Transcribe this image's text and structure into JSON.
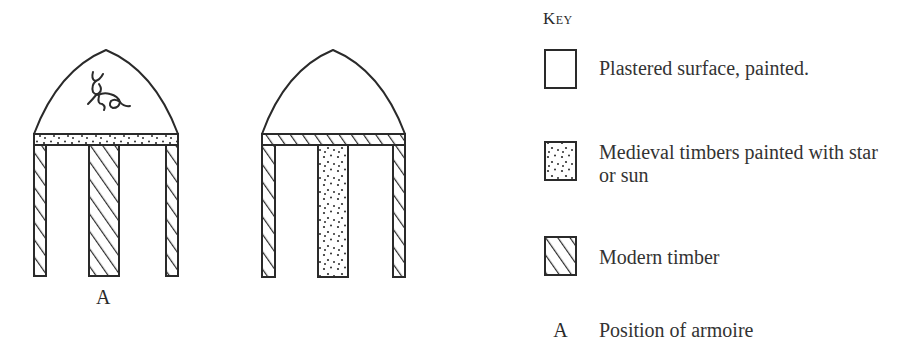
{
  "figures": [
    {
      "id": "left-bay",
      "beam": "medieval-painted",
      "posts": [
        "modern",
        "modern",
        "modern"
      ],
      "tympanum_motif": "deer",
      "label": "A"
    },
    {
      "id": "right-bay",
      "beam": "modern",
      "posts": [
        "modern",
        "medieval-painted",
        "modern"
      ],
      "tympanum_motif": null,
      "label": ""
    }
  ],
  "key": {
    "title": "Key",
    "items": [
      {
        "swatch": "plain",
        "label": "Plastered surface, painted."
      },
      {
        "swatch": "stipple",
        "label": "Medieval timbers painted with star or sun"
      },
      {
        "swatch": "hatch",
        "label": "Modern timber"
      },
      {
        "swatch": "letter",
        "symbol": "A",
        "label": "Position of armoire"
      }
    ]
  },
  "colors": {
    "ink": "#2a2a2a",
    "paper": "#ffffff"
  }
}
